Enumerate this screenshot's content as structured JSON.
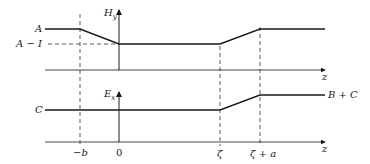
{
  "diagram": {
    "type": "piecewise-linear field profiles",
    "top_panel": {
      "axis_label": "H",
      "axis_subscript": "y",
      "level_labels": {
        "high": "A",
        "low": "A − I"
      },
      "z_label": "z"
    },
    "bottom_panel": {
      "axis_label": "E",
      "axis_subscript": "x",
      "level_labels": {
        "low": "C",
        "high": "B + C"
      },
      "z_label": "z"
    },
    "x_ticks": {
      "minus_b": "−b",
      "zero": "0",
      "zeta": "ζ",
      "zeta_plus_a": "ζ + a"
    }
  }
}
